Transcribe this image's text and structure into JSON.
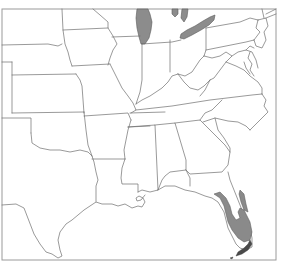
{
  "map": {
    "region": "Eastern United States",
    "type": "species range map",
    "colors": {
      "background": "#ffffff",
      "border": "#6e6e6e",
      "frame": "#9a9a9a",
      "lakes": "#8c8c8c",
      "range": "#8a8a8a",
      "range_dark": "#4a4a4a"
    },
    "features": {
      "lakes": [
        "Lake Michigan",
        "Lake Huron (southern tip)",
        "Lake Erie"
      ],
      "range_areas": [
        "South Florida peninsula (southwest coast to Everglades)",
        "Southeast Florida Atlantic coast",
        "Florida Keys"
      ]
    }
  }
}
